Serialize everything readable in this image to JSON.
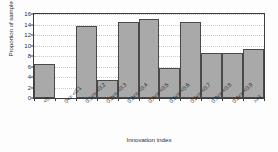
{
  "chart_data": {
    "type": "bar",
    "title": "",
    "xlabel": "Innovation index",
    "ylabel": "Proportion of sample (%)",
    "categories": [
      "<0",
      "0<= <0.1",
      "0.1<= <0.2",
      "0.2<= <0.3",
      "0.3<= <0.4",
      "0.4<= <0.5",
      "0.5<= <0.6",
      "0.6<= <0.7",
      "0.7<= <0.8",
      "0.8<= <0.9",
      ">=1"
    ],
    "values": [
      6.4,
      0,
      13.7,
      3.5,
      14.4,
      15.1,
      5.8,
      14.4,
      8.6,
      8.6,
      9.3
    ],
    "ylim": [
      0,
      16
    ],
    "yticks": [
      0,
      2,
      4,
      6,
      8,
      10,
      12,
      14,
      16
    ],
    "ytick_labels": [
      "0",
      "2",
      "4",
      "6",
      "8",
      "10",
      "12",
      "14",
      "16"
    ],
    "grid": true,
    "legend": "none",
    "bar_color": "#a9a9a9",
    "bar_edge_color": "#4a4a4a",
    "frame_color": "#3c3c3c",
    "grid_color": "#c9c9c9",
    "background": "#ffffff"
  }
}
